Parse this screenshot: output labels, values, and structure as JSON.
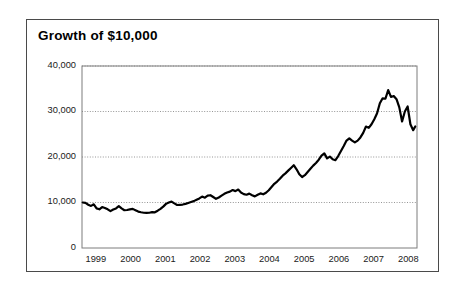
{
  "chart_data": {
    "type": "line",
    "title": "Growth of $10,000",
    "xlabel": "",
    "ylabel": "",
    "xlim": [
      1998.6,
      2008.25
    ],
    "ylim": [
      0,
      40000
    ],
    "grid": true,
    "grid_axis": "y",
    "legend": "none",
    "line_color": "#000000",
    "line_width": 2.2,
    "y_ticks": [
      0,
      10000,
      20000,
      30000,
      40000
    ],
    "y_tick_labels": [
      "0",
      "10,000",
      "20,000",
      "30,000",
      "40,000"
    ],
    "x_ticks": [
      1999,
      2000,
      2001,
      2002,
      2003,
      2004,
      2005,
      2006,
      2007,
      2008
    ],
    "x_tick_labels": [
      "1999",
      "2000",
      "2001",
      "2002",
      "2003",
      "2004",
      "2005",
      "2006",
      "2007",
      "2008"
    ],
    "series": [
      {
        "name": "Growth of $10,000",
        "x": [
          1998.62,
          1998.7,
          1998.78,
          1998.86,
          1998.94,
          1999.02,
          1999.1,
          1999.18,
          1999.26,
          1999.34,
          1999.42,
          1999.5,
          1999.58,
          1999.66,
          1999.74,
          1999.82,
          1999.9,
          1999.98,
          2000.06,
          2000.14,
          2000.22,
          2000.3,
          2000.38,
          2000.46,
          2000.54,
          2000.62,
          2000.7,
          2000.78,
          2000.86,
          2000.94,
          2001.02,
          2001.1,
          2001.18,
          2001.26,
          2001.34,
          2001.42,
          2001.5,
          2001.58,
          2001.66,
          2001.74,
          2001.82,
          2001.9,
          2001.98,
          2002.06,
          2002.14,
          2002.22,
          2002.3,
          2002.38,
          2002.46,
          2002.54,
          2002.62,
          2002.7,
          2002.78,
          2002.86,
          2002.94,
          2003.02,
          2003.1,
          2003.18,
          2003.26,
          2003.34,
          2003.42,
          2003.5,
          2003.58,
          2003.66,
          2003.74,
          2003.82,
          2003.9,
          2003.98,
          2004.06,
          2004.14,
          2004.22,
          2004.3,
          2004.38,
          2004.46,
          2004.54,
          2004.62,
          2004.7,
          2004.78,
          2004.86,
          2004.94,
          2005.02,
          2005.1,
          2005.18,
          2005.26,
          2005.34,
          2005.42,
          2005.5,
          2005.58,
          2005.66,
          2005.74,
          2005.82,
          2005.9,
          2005.98,
          2006.06,
          2006.14,
          2006.22,
          2006.3,
          2006.38,
          2006.46,
          2006.54,
          2006.62,
          2006.7,
          2006.78,
          2006.86,
          2006.94,
          2007.02,
          2007.1,
          2007.18,
          2007.26,
          2007.34,
          2007.42,
          2007.5,
          2007.58,
          2007.66,
          2007.74,
          2007.82,
          2007.9,
          2007.98,
          2008.06,
          2008.14,
          2008.2
        ],
        "y": [
          10000,
          9900,
          9500,
          9250,
          9600,
          8700,
          8500,
          9000,
          8800,
          8500,
          8100,
          8450,
          8700,
          9200,
          8700,
          8300,
          8350,
          8500,
          8600,
          8300,
          8000,
          7850,
          7750,
          7700,
          7750,
          7900,
          7850,
          8200,
          8600,
          9100,
          9700,
          10000,
          10200,
          9800,
          9450,
          9500,
          9550,
          9700,
          9900,
          10100,
          10300,
          10600,
          10900,
          11300,
          11050,
          11500,
          11600,
          11200,
          10800,
          11100,
          11500,
          11900,
          12200,
          12400,
          12750,
          12500,
          12850,
          12200,
          11850,
          11700,
          11950,
          11600,
          11350,
          11700,
          12000,
          11800,
          12150,
          12700,
          13400,
          14100,
          14600,
          15200,
          15900,
          16400,
          17000,
          17600,
          18200,
          17300,
          16200,
          15600,
          16000,
          16700,
          17400,
          18100,
          18700,
          19400,
          20300,
          20800,
          19700,
          20100,
          19500,
          19300,
          20200,
          21300,
          22400,
          23600,
          24100,
          23600,
          23200,
          23600,
          24300,
          25300,
          26700,
          26400,
          27200,
          28300,
          29600,
          31800,
          32900,
          32800,
          34700,
          33200,
          33400,
          32700,
          30900,
          27800,
          30000,
          31100,
          27200,
          25900,
          26700
        ]
      }
    ]
  },
  "axis_geometry": {
    "plot_left": 82,
    "plot_right": 417,
    "plot_top": 66,
    "plot_bottom": 248
  }
}
